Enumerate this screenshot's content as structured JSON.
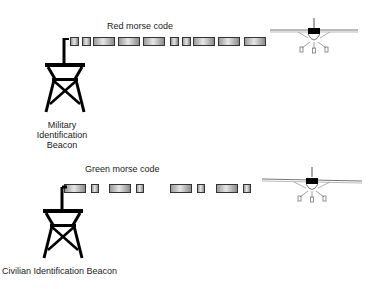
{
  "diagram": {
    "military": {
      "signal_label": "Red morse code",
      "beacon_label_lines": [
        "Military",
        "Identification",
        "Beacon"
      ],
      "morse_blocks": [
        {
          "x": 70,
          "w": 9
        },
        {
          "x": 82,
          "w": 9
        },
        {
          "x": 93,
          "w": 22
        },
        {
          "x": 118,
          "w": 22
        },
        {
          "x": 143,
          "w": 22
        },
        {
          "x": 170,
          "w": 9
        },
        {
          "x": 182,
          "w": 9
        },
        {
          "x": 193,
          "w": 22
        },
        {
          "x": 218,
          "w": 22
        },
        {
          "x": 244,
          "w": 22
        }
      ],
      "pattern": "..---..---"
    },
    "civilian": {
      "signal_label": "Green morse code",
      "beacon_label": "Civilian Identification Beacon",
      "morse_blocks": [
        {
          "x": 64,
          "w": 22
        },
        {
          "x": 91,
          "w": 8
        },
        {
          "x": 109,
          "w": 22
        },
        {
          "x": 136,
          "w": 8
        },
        {
          "x": 170,
          "w": 22
        },
        {
          "x": 197,
          "w": 8
        },
        {
          "x": 216,
          "w": 22
        },
        {
          "x": 243,
          "w": 8
        }
      ],
      "pattern": "-.-.-.-."
    },
    "icons": [
      "radio-tower-icon",
      "airplane-icon"
    ],
    "colors": {
      "ink": "#000000",
      "block_border": "#333333",
      "block_fill": "#c8c8c8"
    }
  }
}
